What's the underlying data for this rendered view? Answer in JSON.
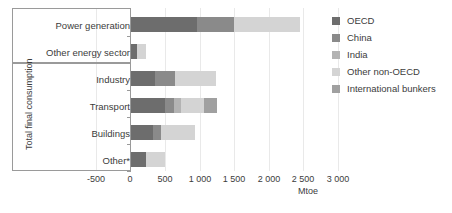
{
  "chart_data": {
    "type": "bar",
    "orientation": "horizontal",
    "stacked": true,
    "title": "",
    "xlabel": "Mtoe",
    "ylabel": "",
    "xlim": [
      -500,
      3000
    ],
    "xticks": [
      -500,
      0,
      500,
      1000,
      1500,
      2000,
      2500,
      3000
    ],
    "xticklabels": [
      "-500",
      "0",
      "500",
      "1 000",
      "1 500",
      "2 000",
      "2 500",
      "3 000"
    ],
    "grid": true,
    "legend_position": "right",
    "categories": [
      "Power generation",
      "Other energy sector",
      "Industry",
      "Transport",
      "Buildings",
      "Other*"
    ],
    "group_labels": [
      {
        "label": "",
        "categories": [
          "Power generation",
          "Other energy sector"
        ]
      },
      {
        "label": "Total final consumption",
        "categories": [
          "Industry",
          "Transport",
          "Buildings",
          "Other*"
        ]
      }
    ],
    "series": [
      {
        "name": "OECD",
        "color": "#6d6d6d",
        "values": [
          960,
          90,
          350,
          500,
          330,
          230
        ]
      },
      {
        "name": "China",
        "color": "#8a8a8a",
        "values": [
          530,
          0,
          300,
          130,
          110,
          0
        ]
      },
      {
        "name": "India",
        "color": "#b3b3b3",
        "values": [
          0,
          0,
          0,
          100,
          0,
          0
        ]
      },
      {
        "name": "Other non-OECD",
        "color": "#d4d4d4",
        "values": [
          960,
          135,
          580,
          330,
          490,
          270
        ]
      },
      {
        "name": "International bunkers",
        "color": "#a0a0a0",
        "values": [
          0,
          0,
          0,
          190,
          0,
          0
        ]
      }
    ],
    "totals": [
      2450,
      225,
      1230,
      1250,
      930,
      500
    ]
  },
  "legend": {
    "items": [
      {
        "label": "OECD",
        "color": "#6d6d6d"
      },
      {
        "label": "China",
        "color": "#8a8a8a"
      },
      {
        "label": "India",
        "color": "#b3b3b3"
      },
      {
        "label": "Other non-OECD",
        "color": "#d4d4d4"
      },
      {
        "label": "International bunkers",
        "color": "#a0a0a0"
      }
    ]
  },
  "axis": {
    "unit_label": "Mtoe",
    "group_title": "Total final consumption"
  }
}
